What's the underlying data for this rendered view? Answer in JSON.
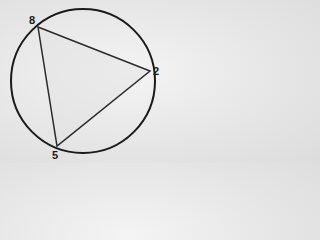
{
  "diagram": {
    "type": "circle-with-inscribed-triangle",
    "circle": {
      "cx": 83,
      "cy": 81,
      "r": 72,
      "stroke": "#1a1a1a"
    },
    "triangle": {
      "stroke": "#2a2a2a",
      "fill": "#e2e2e2"
    },
    "vertices": [
      {
        "label": "8",
        "x": 38,
        "y": 27,
        "lx": 29,
        "ly": 24
      },
      {
        "label": "2",
        "x": 150,
        "y": 71,
        "lx": 153,
        "ly": 75
      },
      {
        "label": "5",
        "x": 57,
        "y": 146,
        "lx": 52,
        "ly": 159
      }
    ]
  }
}
